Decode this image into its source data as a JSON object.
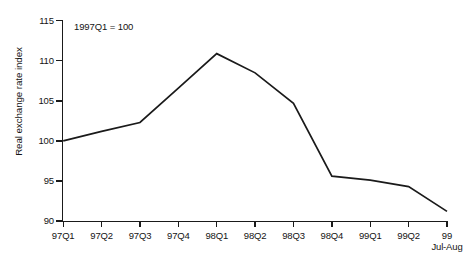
{
  "chart_data": {
    "type": "line",
    "title": "",
    "subtitle": "",
    "annotation": "1997Q1 = 100",
    "xlabel": "",
    "ylabel": "Real exchange rate index",
    "categories": [
      "97Q1",
      "97Q2",
      "97Q3",
      "97Q4",
      "98Q1",
      "98Q2",
      "98Q3",
      "98Q4",
      "99Q1",
      "99Q2",
      "99\nJul-Aug"
    ],
    "series": [
      {
        "name": "Real exchange rate index",
        "values": [
          100.0,
          101.2,
          102.3,
          106.6,
          110.9,
          108.5,
          104.7,
          95.6,
          95.1,
          94.3,
          91.2
        ],
        "color": "#1a1a1a"
      }
    ],
    "ylim": [
      90,
      115
    ],
    "yticks": [
      90,
      95,
      100,
      105,
      110,
      115
    ],
    "ytick_labels": [
      "90",
      "95",
      "100",
      "105",
      "110",
      "115"
    ],
    "grid": false,
    "legend": false,
    "legend_position": "none"
  },
  "axis": {
    "x_labels": [
      {
        "main": "97Q1",
        "sub": ""
      },
      {
        "main": "97Q2",
        "sub": ""
      },
      {
        "main": "97Q3",
        "sub": ""
      },
      {
        "main": "97Q4",
        "sub": ""
      },
      {
        "main": "98Q1",
        "sub": ""
      },
      {
        "main": "98Q2",
        "sub": ""
      },
      {
        "main": "98Q3",
        "sub": ""
      },
      {
        "main": "98Q4",
        "sub": ""
      },
      {
        "main": "99Q1",
        "sub": ""
      },
      {
        "main": "99Q2",
        "sub": ""
      },
      {
        "main": "99",
        "sub": "Jul-Aug"
      }
    ],
    "y_labels": [
      "115",
      "110",
      "105",
      "100",
      "95",
      "90"
    ]
  },
  "colors": {
    "line": "#1a1a1a",
    "axis": "#1a1a1a",
    "text": "#141414",
    "background": "#ffffff"
  }
}
